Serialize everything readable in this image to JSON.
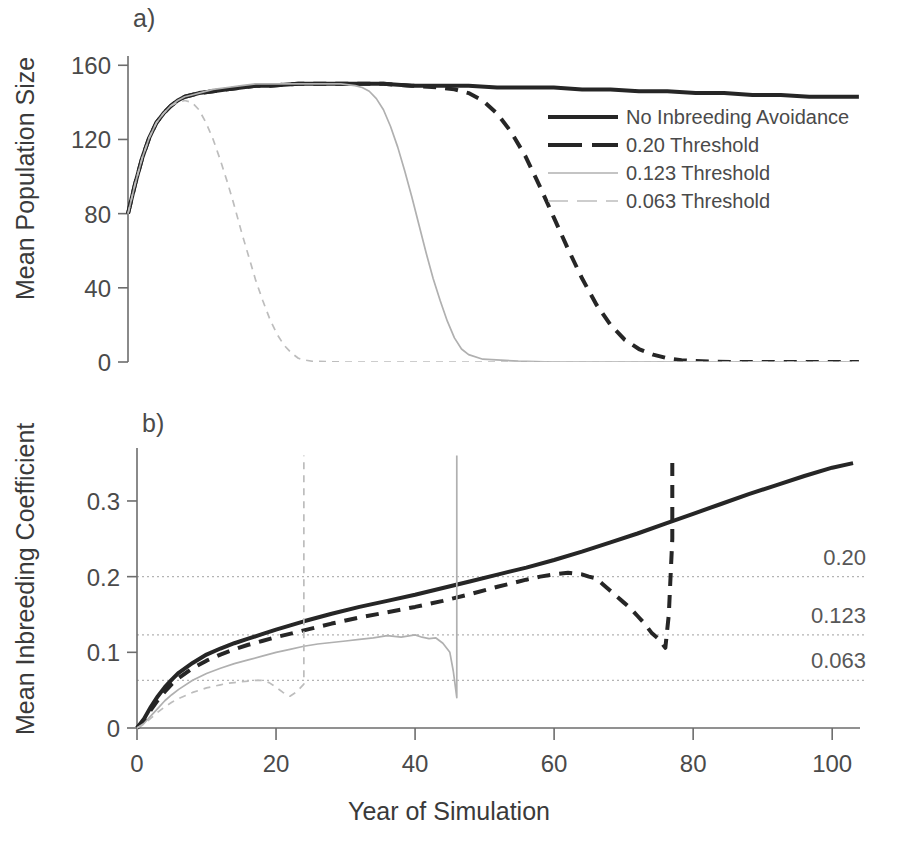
{
  "figure": {
    "background": "#ffffff",
    "ink_black": "#262626",
    "ink_gray": "#b0b0b0",
    "axis_color": "#6d6d6d"
  },
  "panels": [
    {
      "id": "a",
      "label": "a)",
      "ylabel": "Mean Population Size",
      "yticks": [
        0,
        40,
        80,
        120,
        160
      ],
      "ylim": [
        0,
        165
      ],
      "xlim": [
        0,
        104
      ]
    },
    {
      "id": "b",
      "label": "b)",
      "ylabel": "Mean Inbreeding Coefficient",
      "xlabel": "Year of Simulation",
      "yticks": [
        "0",
        "0.1",
        "0.2",
        "0.3"
      ],
      "ytick_values": [
        0,
        0.1,
        0.2,
        0.3
      ],
      "ylim": [
        0,
        0.37
      ],
      "xlim": [
        0,
        104
      ],
      "xticks": [
        0,
        20,
        40,
        60,
        80,
        100
      ],
      "threshold_lines": [
        {
          "value": 0.2,
          "label": "0.20"
        },
        {
          "value": 0.123,
          "label": "0.123"
        },
        {
          "value": 0.063,
          "label": "0.063"
        }
      ]
    }
  ],
  "legend": {
    "position": "panel-a-right",
    "entries": [
      {
        "label": "No Inbreeding Avoidance",
        "style": "solid",
        "color": "#262626",
        "width": 4.2
      },
      {
        "label": "0.20 Threshold",
        "style": "dashed",
        "color": "#262626",
        "width": 4.2
      },
      {
        "label": "0.123 Threshold",
        "style": "solid",
        "color": "#b0b0b0",
        "width": 1.6
      },
      {
        "label": "0.063 Threshold",
        "style": "dashed",
        "color": "#bdbdbd",
        "width": 1.6
      }
    ]
  },
  "chart_data": [
    {
      "type": "line",
      "panel": "a",
      "title": "",
      "xlabel": "Year of Simulation",
      "ylabel": "Mean Population Size",
      "xlim": [
        0,
        104
      ],
      "ylim": [
        0,
        165
      ],
      "xticks": [
        0,
        20,
        40,
        60,
        80,
        100
      ],
      "yticks": [
        0,
        40,
        80,
        120,
        160
      ],
      "grid": false,
      "legend_position": "inside-right",
      "series": [
        {
          "name": "No Inbreeding Avoidance",
          "style": "solid",
          "color": "#262626",
          "x": [
            0,
            1,
            2,
            3,
            4,
            5,
            6,
            7,
            8,
            9,
            10,
            12,
            14,
            16,
            18,
            20,
            24,
            28,
            32,
            36,
            40,
            44,
            48,
            52,
            56,
            60,
            64,
            68,
            72,
            76,
            80,
            84,
            88,
            92,
            96,
            100,
            103
          ],
          "y": [
            80,
            96,
            110,
            121,
            129,
            134,
            138,
            141,
            143,
            144,
            145,
            146,
            147,
            148,
            149,
            149,
            150,
            150,
            150,
            150,
            149,
            149,
            149,
            148,
            148,
            148,
            147,
            147,
            146,
            146,
            145,
            145,
            144,
            144,
            143,
            143,
            143
          ]
        },
        {
          "name": "0.20 Threshold",
          "style": "dashed",
          "color": "#262626",
          "x": [
            0,
            1,
            2,
            3,
            4,
            5,
            6,
            7,
            8,
            9,
            10,
            12,
            14,
            16,
            18,
            20,
            24,
            28,
            32,
            36,
            40,
            44,
            46,
            48,
            50,
            52,
            54,
            56,
            58,
            60,
            62,
            64,
            66,
            68,
            70,
            72,
            74,
            76,
            78,
            80,
            85,
            90,
            95,
            100,
            103
          ],
          "y": [
            80,
            96,
            110,
            121,
            129,
            134,
            138,
            141,
            143,
            144,
            145,
            146,
            147,
            148,
            149,
            149,
            150,
            150,
            150,
            150,
            149,
            148,
            147,
            145,
            141,
            134,
            124,
            111,
            95,
            78,
            61,
            45,
            31,
            20,
            12,
            7,
            4,
            2,
            1,
            0.5,
            0,
            0,
            0,
            0,
            0
          ]
        },
        {
          "name": "0.123 Threshold",
          "style": "solid",
          "color": "#b0b0b0",
          "x": [
            0,
            1,
            2,
            3,
            4,
            5,
            6,
            7,
            8,
            9,
            10,
            12,
            14,
            16,
            18,
            20,
            22,
            24,
            26,
            28,
            30,
            32,
            33,
            34,
            35,
            36,
            37,
            38,
            39,
            40,
            41,
            42,
            43,
            44,
            45,
            46,
            47,
            48,
            50,
            55,
            60,
            70,
            80,
            90,
            100,
            103
          ],
          "y": [
            80,
            96,
            110,
            121,
            129,
            134,
            138,
            141,
            143,
            144,
            145,
            147,
            148,
            149,
            150,
            150,
            150,
            150,
            150,
            150,
            150,
            149,
            148,
            146,
            142,
            136,
            127,
            116,
            103,
            89,
            74,
            59,
            45,
            33,
            22,
            13,
            7,
            4,
            1.5,
            0.5,
            0,
            0,
            0,
            0,
            0,
            0
          ]
        },
        {
          "name": "0.063 Threshold",
          "style": "dashed",
          "color": "#bdbdbd",
          "x": [
            0,
            1,
            2,
            3,
            4,
            5,
            6,
            7,
            8,
            9,
            10,
            11,
            12,
            13,
            14,
            15,
            16,
            17,
            18,
            19,
            20,
            21,
            22,
            23,
            24,
            25,
            26,
            30,
            40,
            50,
            60,
            70,
            80,
            90,
            100,
            103
          ],
          "y": [
            80,
            96,
            110,
            121,
            129,
            134,
            138,
            140,
            141,
            140,
            136,
            129,
            120,
            109,
            97,
            84,
            70,
            57,
            44,
            33,
            23,
            15,
            9,
            5,
            2,
            1,
            0.4,
            0,
            0,
            0,
            0,
            0,
            0,
            0,
            0,
            0
          ]
        }
      ]
    },
    {
      "type": "line",
      "panel": "b",
      "title": "",
      "xlabel": "Year of Simulation",
      "ylabel": "Mean Inbreeding Coefficient",
      "xlim": [
        0,
        104
      ],
      "ylim": [
        0,
        0.37
      ],
      "xticks": [
        0,
        20,
        40,
        60,
        80,
        100
      ],
      "yticks": [
        0,
        0.1,
        0.2,
        0.3
      ],
      "grid": false,
      "reference_lines": [
        0.2,
        0.123,
        0.063
      ],
      "series": [
        {
          "name": "No Inbreeding Avoidance",
          "style": "solid",
          "color": "#262626",
          "x": [
            0,
            1,
            2,
            3,
            4,
            5,
            6,
            8,
            10,
            12,
            14,
            16,
            18,
            20,
            24,
            28,
            32,
            36,
            40,
            44,
            48,
            52,
            56,
            60,
            64,
            68,
            72,
            76,
            80,
            84,
            88,
            92,
            96,
            100,
            103
          ],
          "y": [
            0,
            0.012,
            0.028,
            0.042,
            0.054,
            0.064,
            0.073,
            0.086,
            0.097,
            0.105,
            0.112,
            0.118,
            0.124,
            0.13,
            0.141,
            0.151,
            0.16,
            0.168,
            0.176,
            0.185,
            0.194,
            0.203,
            0.212,
            0.222,
            0.233,
            0.245,
            0.257,
            0.27,
            0.283,
            0.296,
            0.309,
            0.321,
            0.333,
            0.344,
            0.35
          ]
        },
        {
          "name": "0.20 Threshold",
          "style": "dashed",
          "color": "#262626",
          "x": [
            0,
            1,
            2,
            3,
            4,
            5,
            6,
            8,
            10,
            12,
            14,
            16,
            18,
            20,
            24,
            28,
            32,
            36,
            40,
            44,
            48,
            52,
            56,
            58,
            60,
            62,
            64,
            65,
            66,
            67,
            68,
            69,
            70,
            71,
            72,
            73,
            74,
            75,
            76,
            76.5,
            77,
            77,
            77
          ],
          "y": [
            0,
            0.01,
            0.024,
            0.037,
            0.048,
            0.058,
            0.066,
            0.079,
            0.089,
            0.097,
            0.104,
            0.11,
            0.115,
            0.12,
            0.129,
            0.138,
            0.146,
            0.153,
            0.16,
            0.168,
            0.177,
            0.187,
            0.196,
            0.2,
            0.203,
            0.205,
            0.203,
            0.2,
            0.198,
            0.19,
            0.182,
            0.174,
            0.166,
            0.158,
            0.148,
            0.138,
            0.126,
            0.118,
            0.106,
            0.15,
            0.25,
            0.33,
            0.352
          ]
        },
        {
          "name": "0.123 Threshold",
          "style": "solid",
          "color": "#b0b0b0",
          "x": [
            0,
            1,
            2,
            3,
            4,
            5,
            6,
            8,
            10,
            12,
            14,
            16,
            18,
            20,
            22,
            24,
            26,
            28,
            30,
            32,
            34,
            36,
            38,
            40,
            41,
            42,
            43,
            44,
            45,
            45.5,
            46,
            46,
            46,
            46
          ],
          "y": [
            0,
            0.006,
            0.016,
            0.026,
            0.036,
            0.044,
            0.051,
            0.063,
            0.072,
            0.079,
            0.085,
            0.09,
            0.095,
            0.1,
            0.104,
            0.108,
            0.111,
            0.113,
            0.115,
            0.117,
            0.119,
            0.122,
            0.12,
            0.123,
            0.12,
            0.118,
            0.119,
            0.112,
            0.1,
            0.075,
            0.04,
            0.15,
            0.29,
            0.36
          ]
        },
        {
          "name": "0.063 Threshold",
          "style": "dashed",
          "color": "#bdbdbd",
          "x": [
            0,
            1,
            2,
            3,
            4,
            5,
            6,
            7,
            8,
            9,
            10,
            11,
            12,
            13,
            14,
            15,
            16,
            17,
            18,
            19,
            20,
            21,
            22,
            23,
            24,
            24,
            24,
            24
          ],
          "y": [
            0,
            0.005,
            0.013,
            0.021,
            0.028,
            0.034,
            0.039,
            0.043,
            0.047,
            0.05,
            0.053,
            0.055,
            0.057,
            0.059,
            0.06,
            0.061,
            0.062,
            0.063,
            0.063,
            0.06,
            0.054,
            0.047,
            0.042,
            0.048,
            0.058,
            0.16,
            0.29,
            0.36
          ]
        }
      ]
    }
  ]
}
